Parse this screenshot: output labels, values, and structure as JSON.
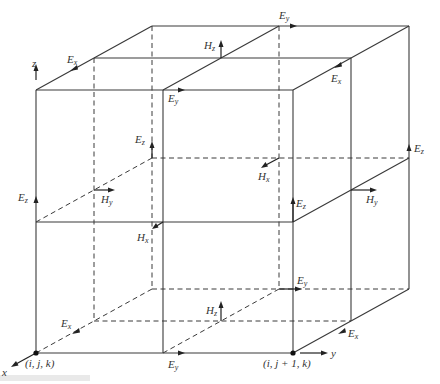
{
  "diagram": {
    "type": "Yee cell lattice (FDTD)",
    "nodes": [
      {
        "id": "origin",
        "label": "(i, j, k)"
      },
      {
        "id": "j_plus_1",
        "label": "(i, j + 1, k)"
      }
    ],
    "axes": {
      "x": "x",
      "y": "y",
      "z": "z"
    },
    "labels": {
      "top_back_Ey": {
        "base": "E",
        "sub": "y"
      },
      "top_left_Ex": {
        "base": "E",
        "sub": "x"
      },
      "top_Hz": {
        "base": "H",
        "sub": "z"
      },
      "top_front_Ey": {
        "base": "E",
        "sub": "y"
      },
      "top_right_Ex": {
        "base": "E",
        "sub": "x"
      },
      "inner_Ez": {
        "base": "E",
        "sub": "z"
      },
      "right_back_Ez": {
        "base": "E",
        "sub": "z"
      },
      "mid_Hx_back": {
        "base": "H",
        "sub": "x"
      },
      "left_Ez": {
        "base": "E",
        "sub": "z"
      },
      "mid_Hy_left": {
        "base": "H",
        "sub": "y"
      },
      "mid_front_Ez": {
        "base": "E",
        "sub": "z"
      },
      "mid_Hy_right": {
        "base": "H",
        "sub": "y"
      },
      "mid_Hx_front": {
        "base": "H",
        "sub": "x"
      },
      "bottom_back_Ey": {
        "base": "E",
        "sub": "y"
      },
      "bottom_Hz": {
        "base": "H",
        "sub": "z"
      },
      "bottom_left_Ex": {
        "base": "E",
        "sub": "x"
      },
      "bottom_right_Ex": {
        "base": "E",
        "sub": "x"
      },
      "bottom_front_Ey": {
        "base": "E",
        "sub": "y"
      }
    },
    "colors": {
      "line": "#3a3a3a",
      "arrow": "#222222",
      "text": "#333333",
      "background": "#ffffff"
    }
  }
}
